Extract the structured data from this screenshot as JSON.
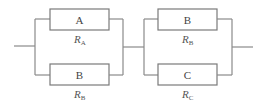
{
  "diagram": {
    "type": "series-parallel circuit",
    "blocks": [
      {
        "top": {
          "label": "A",
          "resistor": "R",
          "sub": "A"
        },
        "bottom": {
          "label": "B",
          "resistor": "R",
          "sub": "B"
        }
      },
      {
        "top": {
          "label": "B",
          "resistor": "R",
          "sub": "B"
        },
        "bottom": {
          "label": "C",
          "resistor": "R",
          "sub": "C"
        }
      }
    ]
  }
}
